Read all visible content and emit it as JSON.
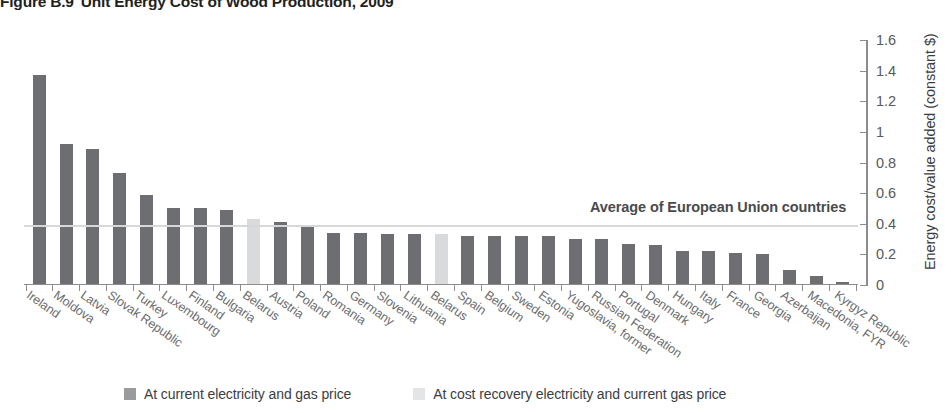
{
  "figure": {
    "number": "Figure B.9",
    "title": "Unit Energy Cost of Wood Production, 2009"
  },
  "annotation": {
    "eu_average_label": "Average of European Union countries"
  },
  "legend": {
    "items": [
      {
        "label": "At current electricity and gas price",
        "color": "#9a9b9d",
        "series": "current"
      },
      {
        "label": "At cost recovery electricity and current gas price",
        "color": "#e4e5e6",
        "series": "cost_recovery"
      }
    ]
  },
  "chart_data": {
    "type": "bar",
    "title": "Unit Energy Cost of Wood Production, 2009",
    "xlabel": "",
    "ylabel": "Energy cost/value added (constant $)",
    "ylim": [
      0,
      1.6
    ],
    "yticks": [
      "0",
      "0.2",
      "0.4",
      "0.6",
      "0.8",
      "1",
      "1.2",
      "1.4",
      "1.6"
    ],
    "ytick_values": [
      0,
      0.2,
      0.4,
      0.6,
      0.8,
      1.0,
      1.2,
      1.4,
      1.6
    ],
    "grid": false,
    "legend_position": "bottom",
    "y_axis_side": "right",
    "categories": [
      "Ireland",
      "Moldova",
      "Latvia",
      "Slovak Republic",
      "Turkey",
      "Luxembourg",
      "Finland",
      "Bulgaria",
      "Belarus",
      "Austria",
      "Poland",
      "Romania",
      "Germany",
      "Slovenia",
      "Lithuania",
      "Belarus",
      "Spain",
      "Belgium",
      "Sweden",
      "Estonia",
      "Yugoslavia, former",
      "Russian Federation",
      "Portugal",
      "Denmark",
      "Hungary",
      "Italy",
      "France",
      "Georgia",
      "Azerbaijan",
      "Macedonia, FYR",
      "Kyrgyz Republic"
    ],
    "series": [
      {
        "name": "At current electricity and gas price",
        "color": "#6d6e71",
        "values": [
          1.37,
          0.92,
          0.89,
          0.73,
          0.59,
          0.5,
          0.5,
          0.49,
          null,
          0.41,
          0.39,
          0.34,
          0.34,
          0.33,
          0.33,
          null,
          0.32,
          0.32,
          0.32,
          0.32,
          0.3,
          0.3,
          0.27,
          0.26,
          0.22,
          0.22,
          0.21,
          0.2,
          0.1,
          0.06,
          0.02
        ]
      },
      {
        "name": "At cost recovery electricity and current gas price",
        "color": "#d9dadb",
        "values": [
          null,
          null,
          null,
          null,
          null,
          null,
          null,
          null,
          0.43,
          null,
          null,
          null,
          null,
          null,
          null,
          0.33,
          null,
          null,
          null,
          null,
          null,
          null,
          null,
          null,
          null,
          null,
          null,
          null,
          null,
          null,
          null
        ]
      }
    ],
    "reference_line": {
      "label": "Average of European Union countries",
      "value": 0.39,
      "color": "#d6d7d8"
    }
  }
}
